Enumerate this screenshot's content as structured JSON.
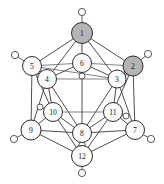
{
  "figure": {
    "width": 164,
    "height": 184,
    "background_color": "#ffffff",
    "line_color": "#3a3a3a",
    "vertex_fill_plain": "#fbfbfb",
    "vertex_fill_shaded": "#b4b4b4",
    "label_color": "#1a1a1a"
  },
  "vertices": [
    {
      "id": "v1",
      "label": "1",
      "cx": 82,
      "cy": 33,
      "r": 10.5,
      "shaded": true,
      "name": "vertex-1"
    },
    {
      "id": "v2",
      "label": "2",
      "cx": 133,
      "cy": 66,
      "r": 10.0,
      "shaded": true,
      "name": "vertex-2"
    },
    {
      "id": "v3",
      "label": "3",
      "cx": 117,
      "cy": 79,
      "r": 9.0,
      "shaded": false,
      "name": "vertex-3"
    },
    {
      "id": "v4",
      "label": "4",
      "cx": 47,
      "cy": 79,
      "r": 9.5,
      "shaded": false,
      "name": "vertex-4"
    },
    {
      "id": "v5",
      "label": "5",
      "cx": 32,
      "cy": 66,
      "r": 9.5,
      "shaded": false,
      "name": "vertex-5"
    },
    {
      "id": "v6",
      "label": "6",
      "cx": 82,
      "cy": 63,
      "r": 9.5,
      "shaded": false,
      "name": "vertex-6"
    },
    {
      "id": "v7",
      "label": "7",
      "cx": 135,
      "cy": 130,
      "r": 9.5,
      "shaded": false,
      "name": "vertex-7"
    },
    {
      "id": "v8",
      "label": "8",
      "cx": 82,
      "cy": 133,
      "r": 9.5,
      "shaded": false,
      "name": "vertex-8"
    },
    {
      "id": "v9",
      "label": "9",
      "cx": 31,
      "cy": 130,
      "r": 10.0,
      "shaded": false,
      "name": "vertex-9"
    },
    {
      "id": "v10",
      "label": "10",
      "cx": 53,
      "cy": 112,
      "r": 9.5,
      "shaded": false,
      "name": "vertex-10"
    },
    {
      "id": "v11",
      "label": "11",
      "cx": 113,
      "cy": 112,
      "r": 9.5,
      "shaded": false,
      "name": "vertex-11"
    },
    {
      "id": "v12",
      "label": "12",
      "cx": 82,
      "cy": 156,
      "r": 10.5,
      "shaded": false,
      "name": "vertex-12"
    }
  ],
  "terminal_groups": [
    {
      "id": "h1",
      "for": "v1",
      "cx": 82,
      "cy": 12,
      "r": 3.6,
      "name": "terminal-h-1"
    },
    {
      "id": "h2",
      "for": "v2",
      "cx": 148,
      "cy": 54,
      "r": 3.6,
      "name": "terminal-h-2"
    },
    {
      "id": "h3",
      "for": "v3",
      "cx": 127,
      "cy": 72,
      "r": 3.0,
      "name": "terminal-h-3"
    },
    {
      "id": "h4",
      "for": "v4",
      "cx": 38,
      "cy": 71,
      "r": 3.0,
      "name": "terminal-h-4"
    },
    {
      "id": "h5",
      "for": "v5",
      "cx": 15,
      "cy": 55,
      "r": 3.6,
      "name": "terminal-h-5"
    },
    {
      "id": "h6",
      "for": "v6",
      "cx": 82,
      "cy": 76,
      "r": 3.0,
      "name": "terminal-h-6"
    },
    {
      "id": "h7",
      "for": "v7",
      "cx": 151,
      "cy": 139,
      "r": 3.6,
      "name": "terminal-h-7"
    },
    {
      "id": "h8",
      "for": "v8",
      "cx": 82,
      "cy": 145,
      "r": 3.2,
      "name": "terminal-h-8"
    },
    {
      "id": "h9",
      "for": "v9",
      "cx": 14,
      "cy": 139,
      "r": 3.6,
      "name": "terminal-h-9"
    },
    {
      "id": "h10",
      "for": "v10",
      "cx": 40,
      "cy": 107,
      "r": 3.0,
      "name": "terminal-h-10"
    },
    {
      "id": "h11",
      "for": "v11",
      "cx": 126,
      "cy": 116,
      "r": 3.0,
      "name": "terminal-h-11"
    },
    {
      "id": "h12",
      "for": "v12",
      "cx": 82,
      "cy": 173,
      "r": 3.6,
      "name": "terminal-h-12"
    }
  ],
  "edges": [
    {
      "from": "v1",
      "to": "v2",
      "style": "solid"
    },
    {
      "from": "v1",
      "to": "v3",
      "style": "solid"
    },
    {
      "from": "v1",
      "to": "v4",
      "style": "solid"
    },
    {
      "from": "v1",
      "to": "v5",
      "style": "solid"
    },
    {
      "from": "v1",
      "to": "v6",
      "style": "solid"
    },
    {
      "from": "v2",
      "to": "v3",
      "style": "solid"
    },
    {
      "from": "v2",
      "to": "v6",
      "style": "thin"
    },
    {
      "from": "v2",
      "to": "v7",
      "style": "solid"
    },
    {
      "from": "v2",
      "to": "v11",
      "style": "solid"
    },
    {
      "from": "v3",
      "to": "v6",
      "style": "solid"
    },
    {
      "from": "v3",
      "to": "v7",
      "style": "solid"
    },
    {
      "from": "v3",
      "to": "v8",
      "style": "solid"
    },
    {
      "from": "v3",
      "to": "v11",
      "style": "solid"
    },
    {
      "from": "v4",
      "to": "v5",
      "style": "solid"
    },
    {
      "from": "v4",
      "to": "v6",
      "style": "solid"
    },
    {
      "from": "v4",
      "to": "v8",
      "style": "solid"
    },
    {
      "from": "v4",
      "to": "v9",
      "style": "solid"
    },
    {
      "from": "v4",
      "to": "v10",
      "style": "solid"
    },
    {
      "from": "v5",
      "to": "v6",
      "style": "thin"
    },
    {
      "from": "v5",
      "to": "v9",
      "style": "solid"
    },
    {
      "from": "v5",
      "to": "v10",
      "style": "solid"
    },
    {
      "from": "v6",
      "to": "v8",
      "style": "solid"
    },
    {
      "from": "v7",
      "to": "v8",
      "style": "solid"
    },
    {
      "from": "v7",
      "to": "v11",
      "style": "solid"
    },
    {
      "from": "v7",
      "to": "v12",
      "style": "solid"
    },
    {
      "from": "v8",
      "to": "v9",
      "style": "solid"
    },
    {
      "from": "v8",
      "to": "v10",
      "style": "solid"
    },
    {
      "from": "v8",
      "to": "v11",
      "style": "solid"
    },
    {
      "from": "v8",
      "to": "v12",
      "style": "solid"
    },
    {
      "from": "v9",
      "to": "v10",
      "style": "solid"
    },
    {
      "from": "v9",
      "to": "v12",
      "style": "solid"
    },
    {
      "from": "v10",
      "to": "v11",
      "style": "thin"
    },
    {
      "from": "v10",
      "to": "v12",
      "style": "solid"
    },
    {
      "from": "v11",
      "to": "v12",
      "style": "solid"
    },
    {
      "from": "v3",
      "to": "v4",
      "style": "thin"
    },
    {
      "from": "v5",
      "to": "v3",
      "style": "thin"
    }
  ]
}
